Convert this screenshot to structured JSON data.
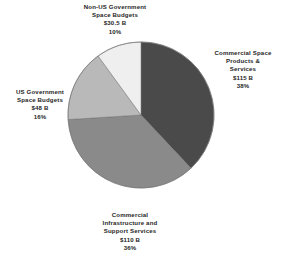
{
  "chart_data": {
    "type": "pie",
    "title": "",
    "subtitle": "",
    "units": "USD billions",
    "legend_position": "outside-labels",
    "grid": false,
    "start_angle_deg": 0,
    "direction": "clockwise",
    "categories": [
      "Commercial Space Products & Services",
      "Commercial Infrastructure and Support Services",
      "US Government Space Budgets",
      "Non-US Government Space Budgets"
    ],
    "values": [
      115,
      110,
      48,
      30.5
    ],
    "percentages": [
      38,
      36,
      16,
      10
    ],
    "total_value": 303.5,
    "colors": [
      "#4a4a4a",
      "#8a8a8a",
      "#b9b9b9",
      "#efefef"
    ],
    "slices": [
      {
        "name": "Commercial Space\nProducts &\nServices",
        "value_label": "$115 B",
        "percent_label": "38%",
        "value": 115,
        "percent": 38,
        "color": "#4a4a4a"
      },
      {
        "name": "Commercial\nInfrastructure and\nSupport Services",
        "value_label": "$110 B",
        "percent_label": "36%",
        "value": 110,
        "percent": 36,
        "color": "#8a8a8a"
      },
      {
        "name": "US Government\nSpace Budgets",
        "value_label": "$48 B",
        "percent_label": "16%",
        "value": 48,
        "percent": 16,
        "color": "#b9b9b9"
      },
      {
        "name": "Non-US Government\nSpace Budgets",
        "value_label": "$30.5 B",
        "percent_label": "10%",
        "value": 30.5,
        "percent": 10,
        "color": "#efefef"
      }
    ]
  },
  "geometry": {
    "center_x": 141,
    "center_y": 115,
    "radius": 73,
    "outline_color": "#6f6f6f"
  }
}
